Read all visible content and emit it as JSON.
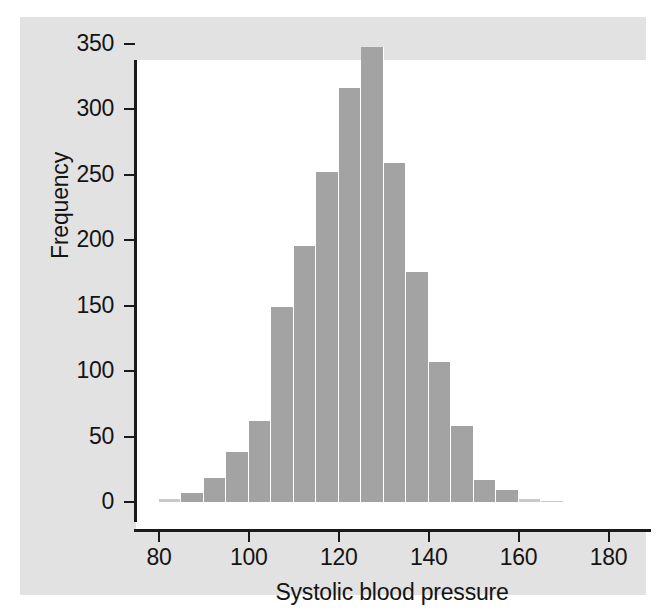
{
  "figure": {
    "background_color": "#ffffff",
    "sheet_color": "#e2e2e2",
    "plot_background": "#ffffff",
    "bar_color": "#a3a3a3",
    "axis_color": "#1a1a1a"
  },
  "chart_data": {
    "type": "bar",
    "chart_subtype": "histogram",
    "title": "",
    "xlabel": "Systolic blood pressure",
    "ylabel": "Frequency",
    "xlim": [
      70,
      185
    ],
    "ylim": [
      0,
      350
    ],
    "grid": false,
    "legend": null,
    "bin_width": 5,
    "x_ticks": [
      80,
      100,
      120,
      140,
      160,
      180
    ],
    "x_tick_labels": [
      "80",
      "100",
      "120",
      "140",
      "160",
      "180"
    ],
    "y_ticks": [
      0,
      50,
      100,
      150,
      200,
      250,
      300,
      350
    ],
    "y_tick_labels": [
      "0",
      "50",
      "100",
      "150",
      "200",
      "250",
      "300",
      "350"
    ],
    "bin_starts": [
      80,
      85,
      90,
      95,
      100,
      105,
      110,
      115,
      120,
      125,
      130,
      135,
      140,
      145,
      150,
      155,
      160,
      165
    ],
    "bin_ends": [
      85,
      90,
      95,
      100,
      105,
      110,
      115,
      120,
      125,
      130,
      135,
      140,
      145,
      150,
      155,
      160,
      165,
      170
    ],
    "categories": [
      "80-85",
      "85-90",
      "90-95",
      "95-100",
      "100-105",
      "105-110",
      "110-115",
      "115-120",
      "120-125",
      "125-130",
      "130-135",
      "135-140",
      "140-145",
      "145-150",
      "150-155",
      "155-160",
      "160-165",
      "165-170"
    ],
    "values": [
      2,
      7,
      18,
      38,
      62,
      149,
      196,
      252,
      316,
      348,
      259,
      176,
      107,
      58,
      17,
      9,
      2,
      1
    ]
  }
}
